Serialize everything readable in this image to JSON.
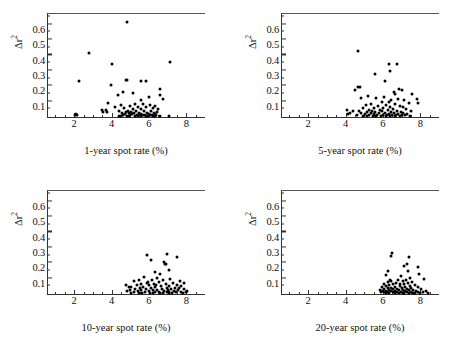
{
  "figure": {
    "background": "#ffffff",
    "point_color": "#000000",
    "axis_color": "#333333"
  },
  "chart_data": [
    {
      "type": "scatter",
      "title": "",
      "xlabel": "1-year spot rate (%)",
      "ylabel": "Δr²",
      "xlim": [
        0.6,
        9.0
      ],
      "ylim": [
        0.0,
        0.67
      ],
      "xticks": [
        2,
        4,
        6,
        8
      ],
      "xtick_labels": [
        "2",
        "4",
        "6",
        "8"
      ],
      "yticks": [
        0.1,
        0.2,
        0.3,
        0.4,
        0.5,
        0.6
      ],
      "ytick_labels": [
        "0.1",
        "0.2",
        "0.3",
        "0.4",
        "0.5",
        "0.6"
      ],
      "grid": false,
      "legend": "none",
      "points": [
        [
          4.85,
          0.615
        ],
        [
          2.8,
          0.418
        ],
        [
          7.15,
          0.358
        ],
        [
          4.0,
          0.342
        ],
        [
          2.25,
          0.232
        ],
        [
          4.75,
          0.24
        ],
        [
          4.85,
          0.238
        ],
        [
          5.55,
          0.235
        ],
        [
          5.85,
          0.234
        ],
        [
          3.95,
          0.21
        ],
        [
          6.6,
          0.182
        ],
        [
          4.6,
          0.162
        ],
        [
          5.15,
          0.158
        ],
        [
          6.6,
          0.142
        ],
        [
          4.35,
          0.14
        ],
        [
          6.0,
          0.128
        ],
        [
          6.75,
          0.118
        ],
        [
          5.6,
          0.112
        ],
        [
          3.8,
          0.088
        ],
        [
          5.25,
          0.086
        ],
        [
          5.7,
          0.082
        ],
        [
          6.05,
          0.08
        ],
        [
          4.5,
          0.076
        ],
        [
          5.0,
          0.074
        ],
        [
          6.35,
          0.072
        ],
        [
          5.4,
          0.068
        ],
        [
          4.2,
          0.064
        ],
        [
          5.85,
          0.062
        ],
        [
          6.2,
          0.06
        ],
        [
          4.65,
          0.058
        ],
        [
          5.15,
          0.054
        ],
        [
          5.55,
          0.052
        ],
        [
          6.5,
          0.05
        ],
        [
          3.5,
          0.046
        ],
        [
          3.7,
          0.044
        ],
        [
          4.4,
          0.042
        ],
        [
          4.9,
          0.04
        ],
        [
          5.3,
          0.038
        ],
        [
          5.75,
          0.037
        ],
        [
          6.1,
          0.036
        ],
        [
          6.45,
          0.035
        ],
        [
          4.75,
          0.032
        ],
        [
          5.05,
          0.03
        ],
        [
          5.45,
          0.029
        ],
        [
          5.9,
          0.028
        ],
        [
          6.25,
          0.027
        ],
        [
          4.55,
          0.025
        ],
        [
          4.95,
          0.024
        ],
        [
          5.2,
          0.023
        ],
        [
          5.6,
          0.022
        ],
        [
          6.0,
          0.021
        ],
        [
          6.3,
          0.02
        ],
        [
          4.7,
          0.018
        ],
        [
          5.1,
          0.017
        ],
        [
          5.5,
          0.016
        ],
        [
          5.8,
          0.015
        ],
        [
          6.15,
          0.014
        ],
        [
          4.6,
          0.013
        ],
        [
          5.0,
          0.012
        ],
        [
          5.35,
          0.011
        ],
        [
          5.7,
          0.011
        ],
        [
          6.05,
          0.01
        ],
        [
          6.4,
          0.01
        ],
        [
          2.05,
          0.014
        ],
        [
          2.15,
          0.01
        ],
        [
          2.1,
          0.022
        ],
        [
          4.5,
          0.008
        ],
        [
          4.85,
          0.008
        ],
        [
          5.25,
          0.007
        ],
        [
          5.6,
          0.007
        ],
        [
          5.95,
          0.006
        ],
        [
          6.3,
          0.006
        ],
        [
          6.6,
          0.006
        ],
        [
          7.1,
          0.008
        ],
        [
          4.4,
          0.006
        ],
        [
          4.95,
          0.005
        ],
        [
          5.4,
          0.005
        ],
        [
          5.85,
          0.004
        ],
        [
          6.2,
          0.004
        ],
        [
          3.55,
          0.03
        ],
        [
          3.75,
          0.034
        ]
      ]
    },
    {
      "type": "scatter",
      "title": "",
      "xlabel": "5-year spot rate (%)",
      "ylabel": "Δr²",
      "xlim": [
        0.6,
        9.0
      ],
      "ylim": [
        0.0,
        0.67
      ],
      "xticks": [
        2,
        4,
        6,
        8
      ],
      "xtick_labels": [
        "2",
        "4",
        "6",
        "8"
      ],
      "yticks": [
        0.1,
        0.2,
        0.3,
        0.4,
        0.5,
        0.6
      ],
      "ytick_labels": [
        "0.1",
        "0.2",
        "0.3",
        "0.4",
        "0.5",
        "0.6"
      ],
      "grid": false,
      "legend": "none",
      "points": [
        [
          4.65,
          0.428
        ],
        [
          6.75,
          0.348
        ],
        [
          6.35,
          0.342
        ],
        [
          6.4,
          0.298
        ],
        [
          5.55,
          0.278
        ],
        [
          6.1,
          0.232
        ],
        [
          4.65,
          0.198
        ],
        [
          4.75,
          0.192
        ],
        [
          4.5,
          0.178
        ],
        [
          6.85,
          0.182
        ],
        [
          7.0,
          0.178
        ],
        [
          6.6,
          0.162
        ],
        [
          7.55,
          0.152
        ],
        [
          6.65,
          0.148
        ],
        [
          5.2,
          0.138
        ],
        [
          6.05,
          0.132
        ],
        [
          4.8,
          0.126
        ],
        [
          5.65,
          0.124
        ],
        [
          6.8,
          0.118
        ],
        [
          7.8,
          0.118
        ],
        [
          6.45,
          0.112
        ],
        [
          7.15,
          0.108
        ],
        [
          5.95,
          0.1
        ],
        [
          6.3,
          0.096
        ],
        [
          7.4,
          0.094
        ],
        [
          7.9,
          0.092
        ],
        [
          5.35,
          0.086
        ],
        [
          6.65,
          0.084
        ],
        [
          5.1,
          0.08
        ],
        [
          6.15,
          0.078
        ],
        [
          6.9,
          0.074
        ],
        [
          5.75,
          0.07
        ],
        [
          6.4,
          0.066
        ],
        [
          7.05,
          0.064
        ],
        [
          4.95,
          0.06
        ],
        [
          5.5,
          0.058
        ],
        [
          6.0,
          0.056
        ],
        [
          6.55,
          0.054
        ],
        [
          7.25,
          0.052
        ],
        [
          5.25,
          0.048
        ],
        [
          5.85,
          0.046
        ],
        [
          6.25,
          0.044
        ],
        [
          6.75,
          0.042
        ],
        [
          7.5,
          0.042
        ],
        [
          4.7,
          0.04
        ],
        [
          5.4,
          0.038
        ],
        [
          5.95,
          0.036
        ],
        [
          6.45,
          0.035
        ],
        [
          6.95,
          0.034
        ],
        [
          4.4,
          0.036
        ],
        [
          5.15,
          0.032
        ],
        [
          5.6,
          0.03
        ],
        [
          6.1,
          0.029
        ],
        [
          6.6,
          0.028
        ],
        [
          7.1,
          0.027
        ],
        [
          4.85,
          0.026
        ],
        [
          5.35,
          0.024
        ],
        [
          5.8,
          0.023
        ],
        [
          6.3,
          0.022
        ],
        [
          6.8,
          0.021
        ],
        [
          7.3,
          0.02
        ],
        [
          4.25,
          0.028
        ],
        [
          5.05,
          0.018
        ],
        [
          5.5,
          0.017
        ],
        [
          6.0,
          0.016
        ],
        [
          6.5,
          0.015
        ],
        [
          7.0,
          0.015
        ],
        [
          4.6,
          0.014
        ],
        [
          5.25,
          0.012
        ],
        [
          5.7,
          0.012
        ],
        [
          6.2,
          0.011
        ],
        [
          6.7,
          0.01
        ],
        [
          7.2,
          0.01
        ],
        [
          4.1,
          0.046
        ],
        [
          4.15,
          0.018
        ],
        [
          4.95,
          0.008
        ],
        [
          5.45,
          0.008
        ],
        [
          5.9,
          0.007
        ],
        [
          6.4,
          0.007
        ],
        [
          6.9,
          0.006
        ],
        [
          7.45,
          0.006
        ],
        [
          5.15,
          0.005
        ],
        [
          5.65,
          0.005
        ],
        [
          6.15,
          0.004
        ],
        [
          6.65,
          0.004
        ]
      ]
    },
    {
      "type": "scatter",
      "title": "",
      "xlabel": "10-year spot rate (%)",
      "ylabel": "Δr²",
      "xlim": [
        0.6,
        9.0
      ],
      "ylim": [
        0.0,
        0.67
      ],
      "xticks": [
        2,
        4,
        6,
        8
      ],
      "xtick_labels": [
        "2",
        "4",
        "6",
        "8"
      ],
      "yticks": [
        0.1,
        0.2,
        0.3,
        0.4,
        0.5,
        0.6
      ],
      "ytick_labels": [
        "0.1",
        "0.2",
        "0.3",
        "0.4",
        "0.5",
        "0.6"
      ],
      "grid": false,
      "legend": "none",
      "points": [
        [
          5.9,
          0.256
        ],
        [
          6.95,
          0.26
        ],
        [
          7.5,
          0.238
        ],
        [
          6.1,
          0.222
        ],
        [
          6.8,
          0.208
        ],
        [
          6.85,
          0.198
        ],
        [
          6.9,
          0.192
        ],
        [
          7.05,
          0.158
        ],
        [
          6.3,
          0.142
        ],
        [
          6.6,
          0.128
        ],
        [
          5.75,
          0.112
        ],
        [
          6.45,
          0.104
        ],
        [
          7.15,
          0.098
        ],
        [
          5.45,
          0.094
        ],
        [
          6.15,
          0.092
        ],
        [
          6.75,
          0.09
        ],
        [
          7.65,
          0.086
        ],
        [
          5.2,
          0.084
        ],
        [
          5.95,
          0.08
        ],
        [
          6.55,
          0.078
        ],
        [
          7.3,
          0.074
        ],
        [
          7.85,
          0.072
        ],
        [
          5.6,
          0.068
        ],
        [
          6.25,
          0.066
        ],
        [
          6.9,
          0.064
        ],
        [
          7.5,
          0.06
        ],
        [
          5.35,
          0.058
        ],
        [
          6.0,
          0.056
        ],
        [
          6.65,
          0.054
        ],
        [
          7.1,
          0.052
        ],
        [
          7.7,
          0.05
        ],
        [
          5.05,
          0.048
        ],
        [
          5.7,
          0.046
        ],
        [
          6.35,
          0.044
        ],
        [
          6.95,
          0.042
        ],
        [
          7.4,
          0.04
        ],
        [
          4.95,
          0.044
        ],
        [
          5.5,
          0.038
        ],
        [
          6.1,
          0.036
        ],
        [
          6.7,
          0.035
        ],
        [
          7.2,
          0.034
        ],
        [
          7.9,
          0.034
        ],
        [
          5.25,
          0.032
        ],
        [
          5.85,
          0.03
        ],
        [
          6.45,
          0.029
        ],
        [
          7.0,
          0.028
        ],
        [
          7.55,
          0.027
        ],
        [
          5.0,
          0.026
        ],
        [
          5.6,
          0.024
        ],
        [
          6.2,
          0.023
        ],
        [
          6.8,
          0.022
        ],
        [
          7.35,
          0.021
        ],
        [
          8.05,
          0.02
        ],
        [
          5.4,
          0.018
        ],
        [
          6.0,
          0.017
        ],
        [
          6.55,
          0.016
        ],
        [
          7.1,
          0.015
        ],
        [
          7.7,
          0.015
        ],
        [
          4.85,
          0.02
        ],
        [
          5.2,
          0.014
        ],
        [
          5.8,
          0.012
        ],
        [
          6.35,
          0.012
        ],
        [
          6.95,
          0.011
        ],
        [
          7.45,
          0.01
        ],
        [
          8.0,
          0.01
        ],
        [
          5.05,
          0.008
        ],
        [
          5.65,
          0.008
        ],
        [
          6.2,
          0.007
        ],
        [
          6.75,
          0.007
        ],
        [
          7.25,
          0.006
        ],
        [
          7.8,
          0.006
        ],
        [
          5.45,
          0.005
        ],
        [
          6.05,
          0.005
        ],
        [
          6.6,
          0.004
        ],
        [
          7.05,
          0.004
        ],
        [
          4.75,
          0.058
        ],
        [
          5.9,
          0.072
        ],
        [
          6.4,
          0.06
        ],
        [
          7.6,
          0.04
        ]
      ]
    },
    {
      "type": "scatter",
      "title": "",
      "xlabel": "20-year spot rate (%)",
      "ylabel": "Δr²",
      "xlim": [
        0.6,
        9.0
      ],
      "ylim": [
        0.0,
        0.67
      ],
      "xticks": [
        2,
        4,
        6,
        8
      ],
      "xtick_labels": [
        "2",
        "4",
        "6",
        "8"
      ],
      "yticks": [
        0.1,
        0.2,
        0.3,
        0.4,
        0.5,
        0.6
      ],
      "ytick_labels": [
        "0.1",
        "0.2",
        "0.3",
        "0.4",
        "0.5",
        "0.6"
      ],
      "grid": false,
      "legend": "none",
      "points": [
        [
          6.5,
          0.268
        ],
        [
          6.45,
          0.25
        ],
        [
          7.4,
          0.238
        ],
        [
          7.3,
          0.198
        ],
        [
          7.15,
          0.182
        ],
        [
          7.9,
          0.178
        ],
        [
          6.25,
          0.152
        ],
        [
          7.35,
          0.148
        ],
        [
          7.95,
          0.128
        ],
        [
          6.15,
          0.122
        ],
        [
          6.95,
          0.114
        ],
        [
          8.2,
          0.1
        ],
        [
          6.8,
          0.094
        ],
        [
          7.25,
          0.092
        ],
        [
          6.45,
          0.086
        ],
        [
          7.05,
          0.082
        ],
        [
          7.55,
          0.08
        ],
        [
          6.25,
          0.076
        ],
        [
          6.7,
          0.074
        ],
        [
          7.35,
          0.07
        ],
        [
          6.05,
          0.068
        ],
        [
          6.55,
          0.066
        ],
        [
          7.15,
          0.062
        ],
        [
          7.7,
          0.06
        ],
        [
          6.35,
          0.056
        ],
        [
          6.9,
          0.054
        ],
        [
          7.45,
          0.052
        ],
        [
          6.15,
          0.05
        ],
        [
          6.65,
          0.048
        ],
        [
          7.2,
          0.046
        ],
        [
          7.85,
          0.044
        ],
        [
          5.95,
          0.044
        ],
        [
          6.45,
          0.042
        ],
        [
          7.0,
          0.04
        ],
        [
          7.5,
          0.038
        ],
        [
          6.25,
          0.036
        ],
        [
          6.75,
          0.035
        ],
        [
          7.3,
          0.034
        ],
        [
          8.05,
          0.032
        ],
        [
          6.05,
          0.032
        ],
        [
          6.55,
          0.03
        ],
        [
          7.1,
          0.029
        ],
        [
          7.6,
          0.028
        ],
        [
          5.85,
          0.028
        ],
        [
          6.35,
          0.026
        ],
        [
          6.85,
          0.025
        ],
        [
          7.4,
          0.024
        ],
        [
          8.3,
          0.022
        ],
        [
          6.15,
          0.022
        ],
        [
          6.65,
          0.021
        ],
        [
          7.2,
          0.02
        ],
        [
          7.75,
          0.019
        ],
        [
          5.95,
          0.018
        ],
        [
          6.45,
          0.017
        ],
        [
          6.95,
          0.016
        ],
        [
          7.5,
          0.015
        ],
        [
          8.15,
          0.014
        ],
        [
          6.25,
          0.013
        ],
        [
          6.75,
          0.012
        ],
        [
          7.3,
          0.012
        ],
        [
          7.9,
          0.011
        ],
        [
          6.05,
          0.01
        ],
        [
          6.55,
          0.01
        ],
        [
          7.05,
          0.009
        ],
        [
          7.6,
          0.008
        ],
        [
          8.4,
          0.008
        ],
        [
          6.35,
          0.007
        ],
        [
          6.85,
          0.007
        ],
        [
          7.4,
          0.006
        ],
        [
          8.0,
          0.006
        ],
        [
          6.15,
          0.005
        ],
        [
          6.65,
          0.005
        ],
        [
          7.15,
          0.004
        ],
        [
          7.7,
          0.004
        ],
        [
          5.9,
          0.012
        ],
        [
          6.4,
          0.092
        ],
        [
          6.9,
          0.064
        ],
        [
          7.45,
          0.104
        ]
      ]
    }
  ]
}
